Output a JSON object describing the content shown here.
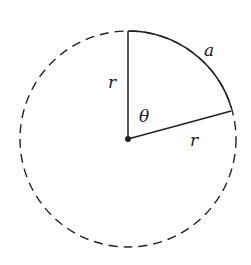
{
  "diagram": {
    "type": "circle-sector",
    "center": {
      "x": 128,
      "y": 139
    },
    "radius": 108,
    "colors": {
      "stroke": "#222222",
      "background": "#ffffff"
    },
    "labels": {
      "radius_vertical": "r",
      "radius_slanted": "r",
      "angle": "θ",
      "arc": "a"
    },
    "sector_endpoints": {
      "top": {
        "x": 128,
        "y": 31
      },
      "right": {
        "x": 231,
        "y": 112
      }
    }
  }
}
